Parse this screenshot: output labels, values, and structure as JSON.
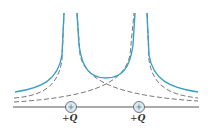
{
  "diagram": {
    "charges": [
      {
        "label_sign": "+",
        "label_symbol": "Q",
        "glyph": "+"
      },
      {
        "label_sign": "+",
        "label_symbol": "Q",
        "glyph": "+"
      }
    ],
    "colors": {
      "total_potential": "#3a9fc4",
      "individual_potential": "#555555",
      "axis": "#444444",
      "charge_fill": "#d6e8f2",
      "charge_stroke": "#555555"
    },
    "curves": {
      "total": "Sum of individual potentials (solid blue)",
      "individual": "Potential of each charge alone (dashed)"
    }
  }
}
